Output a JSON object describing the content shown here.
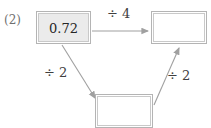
{
  "problem": {
    "number_label": "(2)"
  },
  "diagram": {
    "type": "flow-chart",
    "nodes": [
      {
        "id": "start",
        "value": "0.72",
        "filled": true
      },
      {
        "id": "topright",
        "value": "",
        "filled": false
      },
      {
        "id": "bottom",
        "value": "",
        "filled": false
      }
    ],
    "arrows": [
      {
        "id": "start-to-topright",
        "label": "÷ 4",
        "from": "start",
        "to": "topright"
      },
      {
        "id": "start-to-bottom",
        "label": "÷ 2",
        "from": "start",
        "to": "bottom"
      },
      {
        "id": "bottom-to-topright",
        "label": "÷ 2",
        "from": "bottom",
        "to": "topright"
      }
    ]
  },
  "colors": {
    "background": "#ffffff",
    "box_border": "#b4b4b4",
    "box_fill": "#ebebeb",
    "arrow": "#a0a0a0",
    "text": "#262626",
    "label_text": "#6f6f6f"
  }
}
